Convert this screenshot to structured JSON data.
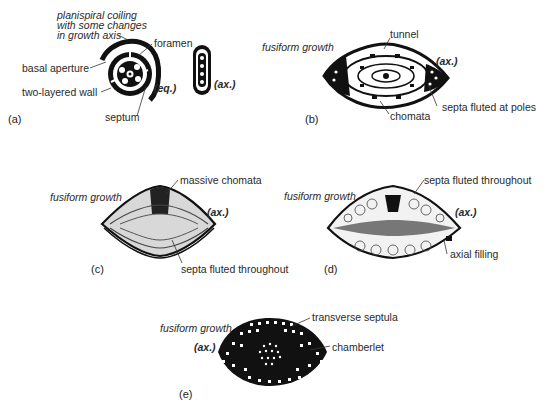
{
  "figure": {
    "panels": [
      {
        "id": "a",
        "label": "(a)",
        "caption_top": [
          "planispiral coiling",
          "with some changes",
          "in growth axis"
        ],
        "annotations": {
          "foramen": "foramen",
          "basal_aperture": "basal aperture",
          "two_layered_wall": "two-layered wall",
          "septum": "septum",
          "equatorial": "(eq.)",
          "axial": "(ax.)"
        }
      },
      {
        "id": "b",
        "label": "(b)",
        "growth": "fusiform growth",
        "annotations": {
          "tunnel": "tunnel",
          "axial": "(ax.)",
          "septa": "septa fluted at poles",
          "chomata": "chomata"
        }
      },
      {
        "id": "c",
        "label": "(c)",
        "growth": "fusiform growth",
        "annotations": {
          "chomata": "massive chomata",
          "axial": "(ax.)",
          "septa": "septa fluted throughout"
        }
      },
      {
        "id": "d",
        "label": "(d)",
        "growth": "fusiform growth",
        "annotations": {
          "septa": "septa fluted throughout",
          "axial": "(ax.)",
          "filling": "axial filling"
        }
      },
      {
        "id": "e",
        "label": "(e)",
        "growth": "fusiform growth",
        "annotations": {
          "axial": "(ax.)",
          "septula": "transverse septula",
          "chamberlet": "chamberlet"
        }
      }
    ]
  }
}
